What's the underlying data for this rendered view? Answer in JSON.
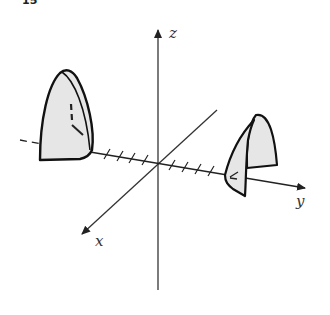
{
  "figure": {
    "number": "15"
  },
  "axes": {
    "x_label": "x",
    "y_label": "y",
    "z_label": "z",
    "y_tick_count_left": 4,
    "y_tick_count_right": 4
  },
  "colors": {
    "line": "#222222",
    "fill": "#e6e6e6",
    "background": "#ffffff"
  }
}
